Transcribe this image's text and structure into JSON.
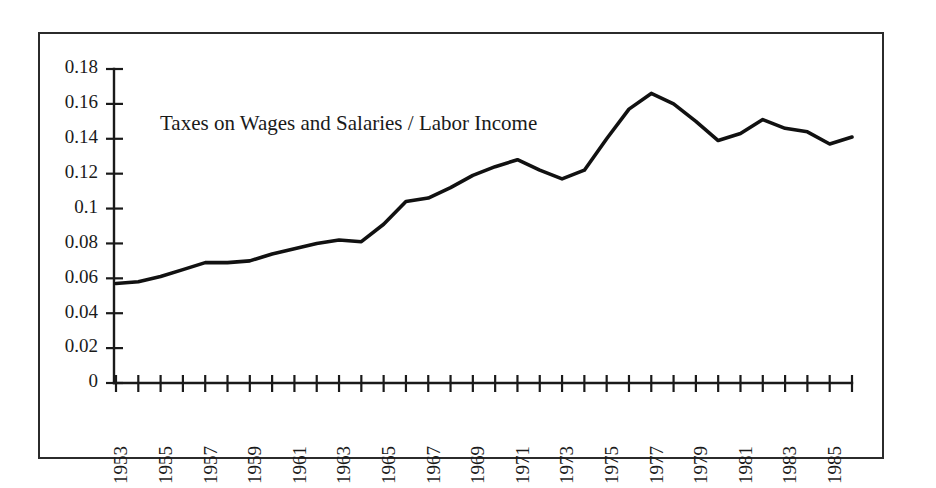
{
  "chart_data": {
    "type": "line",
    "title": "",
    "annotation": "Taxes on Wages and Salaries / Labor Income",
    "xlabel": "",
    "ylabel": "",
    "xlim": [
      1953,
      1986
    ],
    "ylim": [
      0,
      0.18
    ],
    "grid": false,
    "legend_position": "none",
    "y_ticks": [
      "0",
      "0.02",
      "0.04",
      "0.06",
      "0.08",
      "0.1",
      "0.12",
      "0.14",
      "0.16",
      "0.18"
    ],
    "y_tick_values": [
      0,
      0.02,
      0.04,
      0.06,
      0.08,
      0.1,
      0.12,
      0.14,
      0.16,
      0.18
    ],
    "x_tick_labels": [
      "1953",
      "",
      "1955",
      "",
      "1957",
      "",
      "1959",
      "",
      "1961",
      "",
      "1963",
      "",
      "1965",
      "",
      "1967",
      "",
      "1969",
      "",
      "1971",
      "",
      "1973",
      "",
      "1975",
      "",
      "1977",
      "",
      "1979",
      "",
      "1981",
      "",
      "1983",
      "",
      "1985",
      ""
    ],
    "x": [
      1953,
      1954,
      1955,
      1956,
      1957,
      1958,
      1959,
      1960,
      1961,
      1962,
      1963,
      1964,
      1965,
      1966,
      1967,
      1968,
      1969,
      1970,
      1971,
      1972,
      1973,
      1974,
      1975,
      1976,
      1977,
      1978,
      1979,
      1980,
      1981,
      1982,
      1983,
      1984,
      1985,
      1986
    ],
    "series": [
      {
        "name": "Taxes on Wages and Salaries / Labor Income",
        "color": "#111111",
        "values": [
          0.057,
          0.058,
          0.061,
          0.065,
          0.069,
          0.069,
          0.07,
          0.074,
          0.077,
          0.08,
          0.082,
          0.081,
          0.091,
          0.104,
          0.106,
          0.112,
          0.119,
          0.124,
          0.128,
          0.122,
          0.117,
          0.122,
          0.14,
          0.157,
          0.166,
          0.16,
          0.15,
          0.139,
          0.143,
          0.151,
          0.146,
          0.144,
          0.137,
          0.141
        ]
      }
    ]
  },
  "annotations": {
    "series_label": "Taxes on Wages and Salaries / Labor Income"
  }
}
